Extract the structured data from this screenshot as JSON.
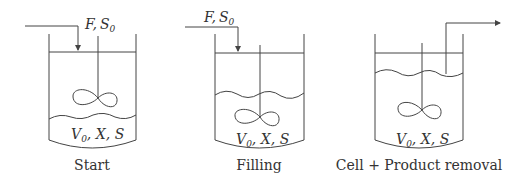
{
  "panels": [
    {
      "id": "start",
      "caption": "Start",
      "feed_label": {
        "var1": "F",
        "sep": ",",
        "var2": "S",
        "sub": "0"
      },
      "contents_label": {
        "v": "V",
        "vsub": "0",
        "rest": ", X, S"
      }
    },
    {
      "id": "filling",
      "caption": "Filling",
      "feed_label": {
        "var1": "F",
        "sep": ",",
        "var2": "S",
        "sub": "0"
      },
      "contents_label": {
        "v": "V",
        "vsub": "0",
        "rest": ", X, S"
      }
    },
    {
      "id": "removal",
      "caption": "Cell + Product removal",
      "contents_label": {
        "v": "V",
        "vsub": "0",
        "rest": ", X, S"
      }
    }
  ],
  "colors": {
    "line": "#444444",
    "text": "#333333",
    "background": "#ffffff"
  }
}
